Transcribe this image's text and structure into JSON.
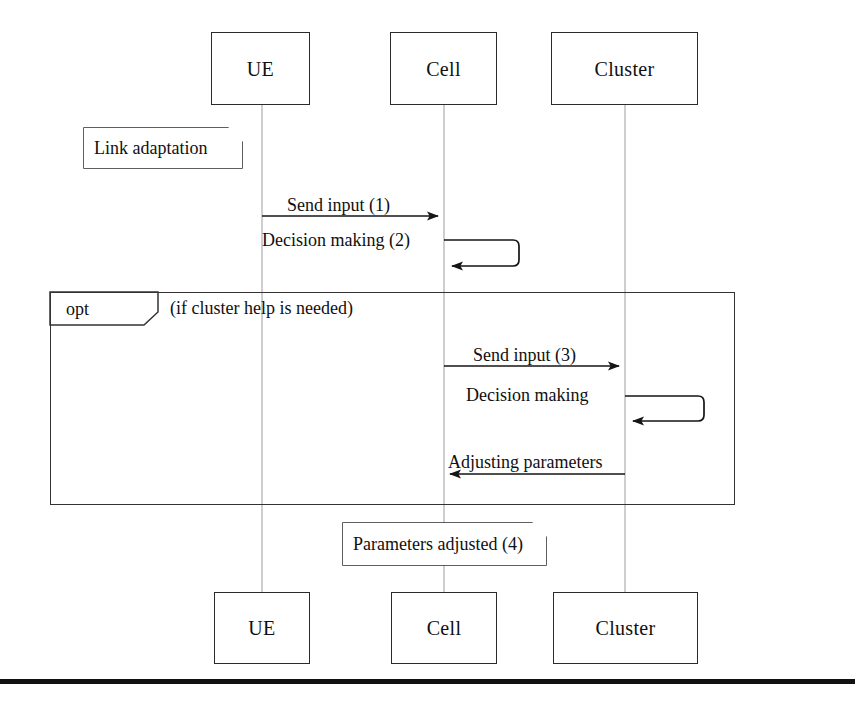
{
  "diagram": {
    "type": "uml-sequence-diagram",
    "background_color": "#ffffff",
    "line_color": "#2b2b2b",
    "lifeline_color": "#bdbdbd",
    "rule_color": "#111111"
  },
  "participants": [
    {
      "id": "ue",
      "label": "UE",
      "x": 262,
      "top_box": {
        "x": 211,
        "y": 32,
        "w": 99,
        "h": 73
      },
      "bottom_box": {
        "x": 214,
        "y": 592,
        "w": 96,
        "h": 72
      }
    },
    {
      "id": "cell",
      "label": "Cell",
      "x": 444,
      "top_box": {
        "x": 390,
        "y": 32,
        "w": 107,
        "h": 73
      },
      "bottom_box": {
        "x": 391,
        "y": 592,
        "w": 106,
        "h": 72
      }
    },
    {
      "id": "cluster",
      "label": "Cluster",
      "x": 625,
      "top_box": {
        "x": 551,
        "y": 32,
        "w": 147,
        "h": 73
      },
      "bottom_box": {
        "x": 553,
        "y": 592,
        "w": 145,
        "h": 72
      }
    }
  ],
  "notes": [
    {
      "id": "note-link-adaptation",
      "label": "Link adaptation",
      "x": 84,
      "y": 128,
      "w": 158,
      "h": 40
    },
    {
      "id": "note-parameters-adjusted",
      "label": "Parameters adjusted (4)",
      "x": 343,
      "y": 523,
      "w": 203,
      "h": 42
    }
  ],
  "messages": [
    {
      "id": "msg-1",
      "label": "Send input (1)",
      "from": "ue",
      "to": "cell",
      "kind": "arrow",
      "direction": "right",
      "y": 216,
      "label_x": 287,
      "label_y": 196
    },
    {
      "id": "msg-2",
      "label": "Decision making (2)",
      "from": "cell",
      "to": "cell",
      "kind": "self",
      "y": 240,
      "loop_bottom": 266,
      "loop_right": 513,
      "label_x": 262,
      "label_y": 231
    },
    {
      "id": "msg-3",
      "label": "Send input (3)",
      "from": "cell",
      "to": "cluster",
      "kind": "arrow",
      "direction": "right",
      "y": 366,
      "label_x": 473,
      "label_y": 346
    },
    {
      "id": "msg-4",
      "label": "Decision making",
      "from": "cluster",
      "to": "cluster",
      "kind": "self",
      "y": 396,
      "loop_bottom": 421,
      "loop_right": 698,
      "label_x": 466,
      "label_y": 386
    },
    {
      "id": "msg-5",
      "label": "Adjusting parameters",
      "from": "cluster",
      "to": "cell",
      "kind": "arrow",
      "direction": "left",
      "y": 474,
      "label_x": 448,
      "label_y": 453
    }
  ],
  "fragments": [
    {
      "id": "fragment-opt",
      "operator": "opt",
      "guard": "(if cluster help is needed)",
      "x": 50,
      "y": 292,
      "w": 685,
      "h": 213,
      "op_box": {
        "w": 108,
        "h": 33,
        "notch": 14
      },
      "op_label_x": 66,
      "op_label_y": 302,
      "guard_x": 170,
      "guard_y": 300
    }
  ],
  "bottom_rule": {
    "y": 679,
    "height": 5,
    "width": 855
  }
}
